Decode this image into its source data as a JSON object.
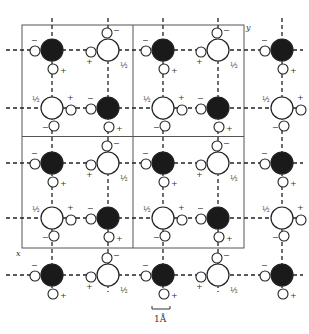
{
  "figure": {
    "type": "lattice-diagram",
    "unit_cell_grid": {
      "cols": 2,
      "rows": 2,
      "left": 22,
      "top": 25,
      "right": 244,
      "bottom": 248
    },
    "axis_labels": {
      "x": "x",
      "y": "y"
    },
    "scale_bar": {
      "label": "1Å",
      "x1": 152,
      "x2": 170,
      "y": 309
    },
    "colors": {
      "dark_atom": "#1a1a1a",
      "open_atom": "#ffffff",
      "stroke": "#2a2a2a",
      "grid": "#555555"
    },
    "lattice": {
      "col_x": [
        52,
        108,
        163,
        218,
        282
      ],
      "row_y": [
        50,
        108,
        163,
        218,
        275
      ],
      "large_radius": 11,
      "small_radius": 5
    },
    "signs": {
      "plus": "+",
      "minus": "−",
      "half": "½"
    }
  }
}
